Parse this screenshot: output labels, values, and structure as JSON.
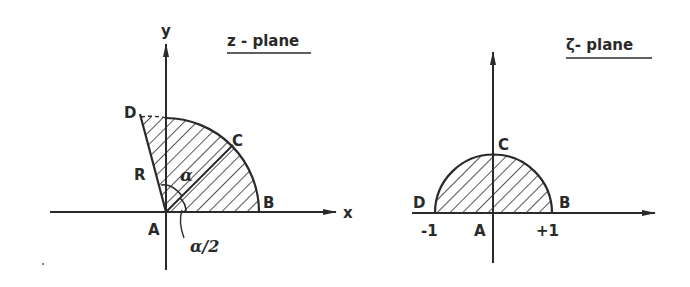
{
  "panels": {
    "z_plane": {
      "title": "z - plane",
      "axis_x_label": "x",
      "axis_y_label": "y",
      "points": {
        "A": "A",
        "B": "B",
        "C": "C",
        "D": "D",
        "R": "R"
      },
      "angle_label": "α",
      "half_angle_label": "α/2"
    },
    "zeta_plane": {
      "title": "ζ- plane",
      "points": {
        "A": "A",
        "B": "B",
        "C": "C",
        "D": "D"
      },
      "tick_left": "-1",
      "tick_right": "+1"
    }
  },
  "colors": {
    "ink": "#2a2a2a",
    "background": "#ffffff"
  }
}
